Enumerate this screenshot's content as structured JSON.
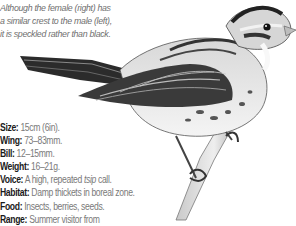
{
  "caption": {
    "lines": [
      "Although the female (right) has",
      "a similar crest to the male (left),",
      "it is speckled rather than black."
    ]
  },
  "illustration": {
    "subject": "female sparrow-like bird perched on branch",
    "style": "grayscale pencil drawing"
  },
  "facts": [
    {
      "key": "Size:",
      "value": "15cm (6in)."
    },
    {
      "key": "Wing:",
      "value": "73–83mm."
    },
    {
      "key": "Bill:",
      "value": "12–15mm."
    },
    {
      "key": "Weight:",
      "value": "16–21g."
    },
    {
      "key": "Voice:",
      "value_pre": "A high, repeated ",
      "value_italic": "tsip",
      "value_post": " call."
    },
    {
      "key": "Habitat:",
      "value": "Damp thickets in boreal zone."
    },
    {
      "key": "Food:",
      "value": "Insects, berries, seeds."
    },
    {
      "key": "Range:",
      "value": "Summer visitor from"
    }
  ]
}
